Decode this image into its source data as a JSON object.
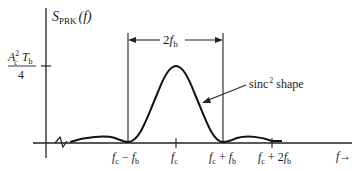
{
  "diagram": {
    "y_axis_label": {
      "main": "S",
      "sub": "PRK",
      "arg": "(f)"
    },
    "y_tick_label": {
      "num_base": "A",
      "num_sup": "2",
      "num_sub": "c",
      "num_T": "T",
      "num_T_sub": "b",
      "den": "4"
    },
    "bandwidth_label": {
      "prefix": "2",
      "f": "f",
      "sub": "b"
    },
    "curve_annotation": {
      "text": "sinc",
      "sup": "2",
      "suffix": " shape"
    },
    "x_axis_label": "f→",
    "x_ticks": [
      {
        "label": "fc − fb",
        "f": "f",
        "sub1": "c",
        "op": " − ",
        "f2": "f",
        "sub2": "b"
      },
      {
        "label": "fc",
        "f": "f",
        "sub1": "c"
      },
      {
        "label": "fc + fb",
        "f": "f",
        "sub1": "c",
        "op": " + ",
        "f2": "f",
        "sub2": "b"
      },
      {
        "label": "fc + 2fb",
        "f": "f",
        "sub1": "c",
        "op": " + 2",
        "f2": "f",
        "sub2": "b"
      }
    ],
    "curve_type": "sinc^2 power spectral density centered at fc, main lobe width 2fb"
  }
}
